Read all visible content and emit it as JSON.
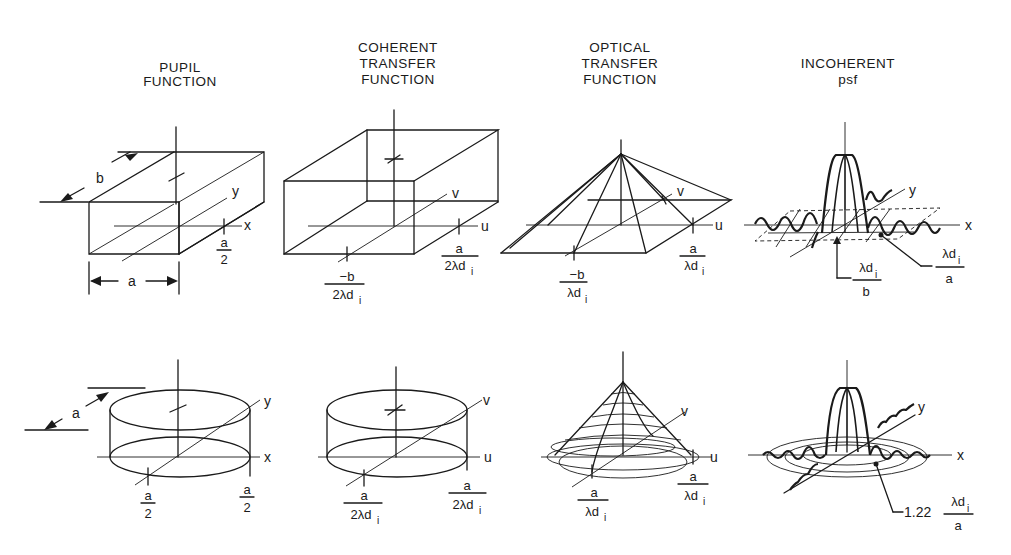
{
  "columns": [
    {
      "title_line1": "PUPIL",
      "title_line2": "FUNCTION"
    },
    {
      "title_line1": "COHERENT",
      "title_line2": "TRANSFER",
      "title_line3": "FUNCTION"
    },
    {
      "title_line1": "OPTICAL",
      "title_line2": "TRANSFER",
      "title_line3": "FUNCTION"
    },
    {
      "title_line1": "INCOHERENT",
      "title_line2": "psf"
    }
  ],
  "rect_row": {
    "pupil": {
      "dim_b": "b",
      "dim_a": "a",
      "axis_x": "x",
      "axis_y": "y",
      "tick_num": "a",
      "tick_den": "2"
    },
    "coherent": {
      "axis_u": "u",
      "axis_v": "v",
      "u_num": "a",
      "u_den": "2λd",
      "u_sub": "i",
      "v_num": "−b",
      "v_den": "2λd",
      "v_sub": "i"
    },
    "otf": {
      "axis_u": "u",
      "axis_v": "v",
      "u_num": "a",
      "u_den": "λd",
      "u_sub": "i",
      "v_num": "−b",
      "v_den": "λd",
      "v_sub": "i"
    },
    "psf": {
      "axis_x": "x",
      "axis_y": "y",
      "x_num": "λd",
      "x_sub": "i",
      "x_den": "a",
      "y_num": "λd",
      "y_sub": "i",
      "y_den": "b"
    }
  },
  "circ_row": {
    "pupil": {
      "dim_a": "a",
      "axis_x": "x",
      "axis_y": "y",
      "y_num": "a",
      "y_den": "2",
      "x_num": "a",
      "x_den": "2"
    },
    "coherent": {
      "axis_u": "u",
      "axis_v": "v",
      "v_num": "a",
      "v_den": "2λd",
      "v_sub": "i",
      "u_num": "a",
      "u_den": "2λd",
      "u_sub": "i"
    },
    "otf": {
      "axis_u": "u",
      "axis_v": "v",
      "v_num": "a",
      "v_den": "λd",
      "v_sub": "i",
      "u_num": "a",
      "u_den": "λd",
      "u_sub": "i"
    },
    "psf": {
      "axis_x": "x",
      "axis_y": "y",
      "coef": "1.22",
      "r_num": "λd",
      "r_sub": "i",
      "r_den": "a"
    }
  }
}
